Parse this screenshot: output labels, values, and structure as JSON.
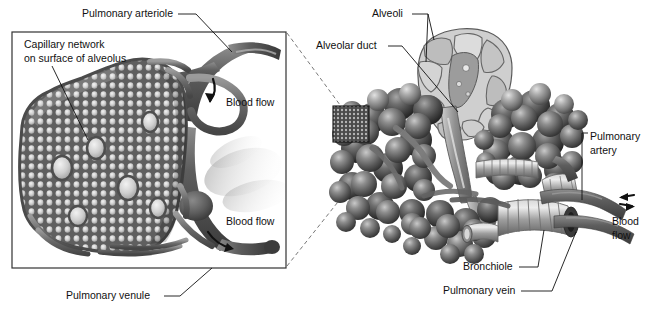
{
  "figure": {
    "background_color": "#ffffff",
    "ink_color": "#111111"
  },
  "left_panel": {
    "name": "capillary-network-detail-panel",
    "border_color": "#333333",
    "labels": {
      "pulmonary_arteriole": "Pulmonary arteriole",
      "capillary_network_line1": "Capillary network",
      "capillary_network_line2": "on surface of alveolus",
      "blood_flow_in": "Blood flow",
      "blood_flow_out": "Blood flow",
      "pulmonary_venule": "Pulmonary venule"
    }
  },
  "right_panel": {
    "name": "alveolar-sac-overview",
    "labels": {
      "alveoli": "Alveoli",
      "alveolar_duct": "Alveolar duct",
      "pulmonary_artery_line1": "Pulmonary",
      "pulmonary_artery_line2": "artery",
      "blood_flow_line1": "Blood",
      "blood_flow_line2": "flow",
      "bronchiole": "Bronchiole",
      "pulmonary_vein": "Pulmonary vein"
    }
  },
  "colors": {
    "vessel_dark": "#4a4a4a",
    "vessel_mid": "#6e6e6e",
    "vessel_light": "#9a9a9a",
    "alveolus_dark": "#3f3f3f",
    "alveolus_mid": "#6b6b6b",
    "alveolus_light": "#a8a8a8",
    "duct_light": "#b5b5b5",
    "outline": "#2a2a2a"
  }
}
